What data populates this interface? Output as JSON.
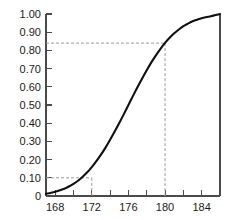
{
  "chart_data": {
    "type": "line",
    "title": "",
    "subtitle": "",
    "xlabel": "",
    "ylabel": "",
    "xlim": [
      167,
      186
    ],
    "ylim": [
      0,
      1
    ],
    "grid": false,
    "legend": null,
    "x_ticks_major": [
      168,
      172,
      176,
      180,
      184
    ],
    "x_ticks_minor": [
      170,
      174,
      178,
      182,
      186
    ],
    "x_tick_labels": [
      "168",
      "172",
      "176",
      "180",
      "184"
    ],
    "y_ticks": [
      0,
      0.1,
      0.2,
      0.3,
      0.4,
      0.5,
      0.6,
      0.7,
      0.8,
      0.9,
      1.0
    ],
    "y_tick_labels": [
      "0",
      "0.10",
      "0.20",
      "0.30",
      "0.40",
      "0.50",
      "0.60",
      "0.70",
      "0.80",
      "0.90",
      "1.00"
    ],
    "series": [
      {
        "name": "cumulative-distribution",
        "color": "#101010",
        "x": [
          167.0,
          167.5,
          168.0,
          168.5,
          169.0,
          169.5,
          170.0,
          170.5,
          171.0,
          171.5,
          172.0,
          172.5,
          173.0,
          173.5,
          174.0,
          174.5,
          175.0,
          175.5,
          176.0,
          176.5,
          177.0,
          177.5,
          178.0,
          178.5,
          179.0,
          179.5,
          180.0,
          180.5,
          181.0,
          181.5,
          182.0,
          182.5,
          183.0,
          183.5,
          184.0,
          184.5,
          185.0,
          185.5,
          186.0
        ],
        "y": [
          0.012,
          0.017,
          0.023,
          0.031,
          0.04,
          0.052,
          0.067,
          0.084,
          0.106,
          0.13,
          0.159,
          0.191,
          0.227,
          0.266,
          0.309,
          0.354,
          0.401,
          0.45,
          0.5,
          0.55,
          0.599,
          0.646,
          0.691,
          0.734,
          0.773,
          0.809,
          0.841,
          0.869,
          0.894,
          0.915,
          0.933,
          0.947,
          0.96,
          0.969,
          0.977,
          0.983,
          0.988,
          0.994,
          1.0
        ]
      }
    ],
    "reference_lines": [
      {
        "name": "lower-reference",
        "x": 172,
        "y": 0.1,
        "style": "dashed",
        "color": "#9a9a9a"
      },
      {
        "name": "upper-reference",
        "x": 180,
        "y": 0.84,
        "style": "dashed",
        "color": "#9a9a9a"
      }
    ],
    "axis_color": "#4a4a4a"
  }
}
